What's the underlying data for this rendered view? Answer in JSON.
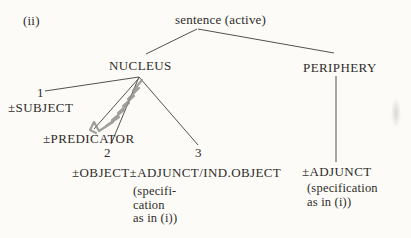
{
  "figure": {
    "item_label": "(ii)",
    "root_label": "sentence (active)",
    "nucleus": {
      "label": "NUCLEUS",
      "index1": "1",
      "subject": "±SUBJECT",
      "predicator": "±PREDICATOR",
      "index2": "2",
      "index3": "3",
      "object_adjunct": "±OBJECT±ADJUNCT/IND.OBJECT",
      "spec_note": "(specifi-\ncation\nas in (i))"
    },
    "periphery": {
      "label": "PERIPHERY",
      "adjunct": "±ADJUNCT",
      "spec_note": "(specification\nas in (i))"
    },
    "annotations": {
      "pencil_scribble": "hand-drawn pencil zigzag over nucleus-to-predicator branch"
    },
    "colors": {
      "background": "#fcfbf8",
      "ink": "#2e2b28",
      "line": "#55514d",
      "pencil": "#8e8e8b"
    }
  }
}
